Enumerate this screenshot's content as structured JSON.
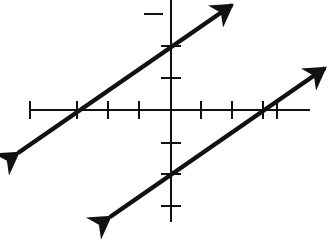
{
  "diagram": {
    "type": "coordinate-plane",
    "colors": {
      "background": "#ffffff",
      "ink": "#111111"
    },
    "origin_px": [
      171,
      110
    ],
    "unit_px": 31,
    "x_axis": {
      "from_px": 30,
      "to_px": 310,
      "y_px": 110,
      "ticks_px": [
        30,
        77,
        108,
        139,
        201,
        232,
        263,
        277
      ]
    },
    "y_axis": {
      "from_px": 0,
      "to_px": 222,
      "x_px": 171,
      "ticks_px": [
        14,
        46,
        78,
        143,
        174,
        206
      ]
    },
    "lines": [
      {
        "name": "upper-line",
        "from_px": [
          18,
          153
        ],
        "to_px": [
          232,
          5
        ],
        "y_intercept_px": 46,
        "x_intercept_px": 77
      },
      {
        "name": "lower-line",
        "from_px": [
          110,
          217
        ],
        "to_px": [
          325,
          68
        ],
        "y_intercept_px": 174,
        "x_intercept_px": 263
      }
    ]
  }
}
